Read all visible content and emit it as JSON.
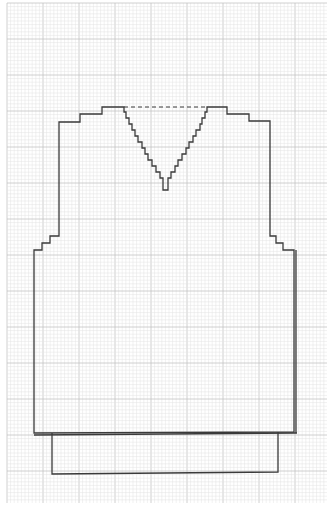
{
  "diagram": {
    "type": "knitting-schematic",
    "paper": "graph paper",
    "grid": {
      "minor_cells_per_major": 10,
      "minor_color": "#e2e2e2",
      "major_color": "#c4c4c4"
    },
    "line_color": "#3a3a3a",
    "pieces": [
      {
        "name": "body",
        "description": "front body outline with armhole and shoulder steps"
      },
      {
        "name": "v-neck",
        "description": "stepped V-neck shaping",
        "top_edge": "dashed"
      },
      {
        "name": "ribbing",
        "description": "bottom rib band rectangle"
      }
    ],
    "shaping": {
      "shoulder_steps_each_side": 3,
      "armhole_steps_each_side": 3,
      "neck_steps_each_side": 12
    }
  }
}
